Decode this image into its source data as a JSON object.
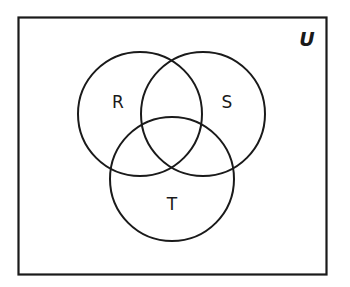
{
  "diagram": {
    "type": "venn",
    "universe": {
      "label": "U",
      "x": 18,
      "y": 17,
      "width": 308,
      "height": 257
    },
    "sets": [
      {
        "label": "R",
        "cx": 140,
        "cy": 114,
        "r": 62,
        "label_x": 118,
        "label_y": 108
      },
      {
        "label": "S",
        "cx": 203,
        "cy": 114,
        "r": 62,
        "label_x": 227,
        "label_y": 108
      },
      {
        "label": "T",
        "cx": 172,
        "cy": 179,
        "r": 62,
        "label_x": 172,
        "label_y": 210
      }
    ],
    "stroke_color": "#1a1a1a",
    "background_color": "#ffffff"
  }
}
